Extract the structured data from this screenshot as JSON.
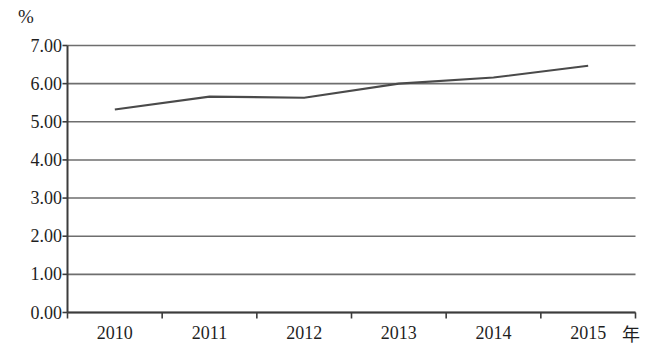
{
  "chart_data": {
    "type": "line",
    "title": "",
    "subtitle": "",
    "xlabel": "年",
    "ylabel": "%",
    "categories": [
      "2010",
      "2011",
      "2012",
      "2013",
      "2014",
      "2015"
    ],
    "x": [
      2010,
      2011,
      2012,
      2013,
      2014,
      2015
    ],
    "values": [
      5.32,
      5.66,
      5.63,
      6.0,
      6.16,
      6.47
    ],
    "series": [
      {
        "name": "",
        "values": [
          5.32,
          5.66,
          5.63,
          6.0,
          6.16,
          6.47
        ]
      }
    ],
    "ylim": [
      0.0,
      7.0
    ],
    "ytick_step": 1.0,
    "ytick_labels": [
      "7.00",
      "6.00",
      "5.00",
      "4.00",
      "3.00",
      "2.00",
      "1.00",
      "0.00"
    ],
    "ytick_values": [
      7.0,
      6.0,
      5.0,
      4.0,
      3.0,
      2.0,
      1.0,
      0.0
    ],
    "xtick_labels": [
      "2010",
      "2011",
      "2012",
      "2013",
      "2014",
      "2015"
    ],
    "grid": "horizontal",
    "legend": "none",
    "legend_position": "none",
    "markers": "none",
    "line_color": "#4a4a4a",
    "grid_color": "#6e6e6e",
    "axis_color": "#3c3c3c",
    "background_color": "#ffffff",
    "annotations": []
  },
  "axis": {
    "y_unit": "%",
    "x_unit": "年"
  }
}
